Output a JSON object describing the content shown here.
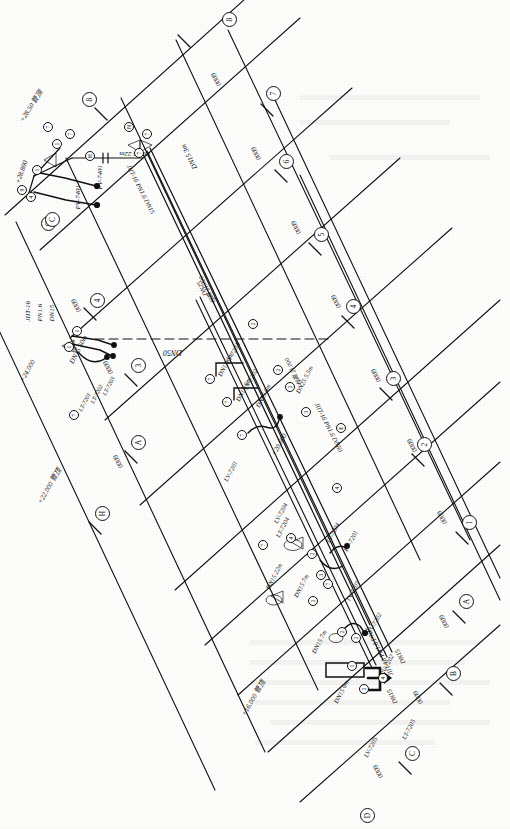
{
  "drawing": {
    "type": "piping-instrumentation-isometric",
    "orientation": "rotated-90",
    "sheet_color": "#fdfdfc",
    "line_color": "#111111",
    "grid_dimension_label": "6000"
  },
  "grid": {
    "column_markers": [
      "1",
      "2",
      "3",
      "4",
      "5",
      "6",
      "7",
      "8"
    ],
    "row_markers": [
      "A",
      "B",
      "C",
      "D",
      "E",
      "F",
      "G",
      "H"
    ],
    "dimension_labels": [
      "6000",
      "6000",
      "6000",
      "6000",
      "6000",
      "6000",
      "6000",
      "6000",
      "6000",
      "6000",
      "6000",
      "6000"
    ]
  },
  "spec_notes": [
    {
      "id": "spec-1",
      "line1": "JIIT-16",
      "line2": "PN1.6",
      "line3": "DN15"
    },
    {
      "id": "spec-2",
      "text": "JIIT-16 PN1.6 DN15"
    },
    {
      "id": "spec-3",
      "text": "JIIT-16 PN1.6 DN60"
    },
    {
      "id": "spec-4",
      "text": "JIIT-16 PN1.6 DN15"
    }
  ],
  "elevations": [
    {
      "id": "elev-1",
      "text": "+28.50 管顶"
    },
    {
      "id": "elev-2",
      "text": "+28.800"
    },
    {
      "id": "elev-3",
      "text": "+24.000"
    },
    {
      "id": "elev-4",
      "text": "+22.000 管顶"
    },
    {
      "id": "elev-5",
      "text": "+20.600"
    },
    {
      "id": "elev-6",
      "text": "+16.000 管顶"
    },
    {
      "id": "elev-7",
      "text": "标高 21.000"
    },
    {
      "id": "elev-8",
      "text": "标高 21.000"
    }
  ],
  "pipe_labels": [
    {
      "id": "pipe-1",
      "text": "DN15 22m"
    },
    {
      "id": "pipe-2",
      "text": "DN15 3m"
    },
    {
      "id": "pipe-3",
      "text": "DN15 50m"
    },
    {
      "id": "pipe-4",
      "text": "DN50"
    },
    {
      "id": "pipe-5",
      "text": "DN15 6m"
    },
    {
      "id": "pipe-6",
      "text": "DN15 6m"
    },
    {
      "id": "pipe-7",
      "text": "DN15 6m"
    },
    {
      "id": "pipe-8",
      "text": "DN25 5.5m"
    },
    {
      "id": "pipe-9",
      "text": "DN25"
    },
    {
      "id": "pipe-10",
      "text": "DN15 22m"
    },
    {
      "id": "pipe-11",
      "text": "DN15 7m"
    },
    {
      "id": "pipe-12",
      "text": "DN15 7m"
    },
    {
      "id": "pipe-13",
      "text": "DN15 6m"
    },
    {
      "id": "pipe-14",
      "text": "DN15"
    },
    {
      "id": "pipe-15",
      "text": "DN15"
    }
  ],
  "instrument_tags": [
    {
      "id": "tag-1",
      "text": "PV-7401"
    },
    {
      "id": "tag-2",
      "text": "PV-7401"
    },
    {
      "id": "tag-3",
      "text": "LT-7201"
    },
    {
      "id": "tag-4",
      "text": "LT-7202"
    },
    {
      "id": "tag-5",
      "text": "LT-7203"
    },
    {
      "id": "tag-6",
      "text": "LV-720A"
    },
    {
      "id": "tag-7",
      "text": "LV-7202"
    },
    {
      "id": "tag-8",
      "text": "LV-7201"
    },
    {
      "id": "tag-9",
      "text": "LT-7204"
    },
    {
      "id": "tag-10",
      "text": "TV-7204"
    },
    {
      "id": "tag-11",
      "text": "PV-7201"
    },
    {
      "id": "tag-12",
      "text": "TV-7201"
    },
    {
      "id": "tag-13",
      "text": "TV-7202"
    },
    {
      "id": "tag-14",
      "text": "PV-7202"
    },
    {
      "id": "tag-15",
      "text": "LT-7205"
    },
    {
      "id": "tag-16",
      "text": "LV-7205"
    },
    {
      "id": "tag-17",
      "text": "LV-7204"
    }
  ],
  "bubbles": {
    "grid_column": [
      {
        "label": "8",
        "x": 228,
        "y": 18
      },
      {
        "label": "7",
        "x": 272,
        "y": 92
      },
      {
        "label": "6",
        "x": 285,
        "y": 160
      },
      {
        "label": "5",
        "x": 320,
        "y": 233
      },
      {
        "label": "4",
        "x": 352,
        "y": 305
      },
      {
        "label": "3",
        "x": 392,
        "y": 377
      },
      {
        "label": "2",
        "x": 423,
        "y": 443
      },
      {
        "label": "1",
        "x": 468,
        "y": 521
      }
    ],
    "grid_row": [
      {
        "label": "8",
        "x": 88,
        "y": 98
      },
      {
        "label": "G",
        "x": 47,
        "y": 222
      },
      {
        "label": "4",
        "x": 96,
        "y": 299
      },
      {
        "label": "3",
        "x": 137,
        "y": 364
      },
      {
        "label": "A",
        "x": 137,
        "y": 441
      },
      {
        "label": "H",
        "x": 101,
        "y": 512
      },
      {
        "label": "A",
        "x": 465,
        "y": 600
      },
      {
        "label": "B",
        "x": 452,
        "y": 672
      },
      {
        "label": "C",
        "x": 411,
        "y": 752
      },
      {
        "label": "D",
        "x": 366,
        "y": 814
      },
      {
        "label": "C",
        "x": 51,
        "y": 218
      }
    ],
    "instrument": [
      {
        "label": "7",
        "x": 47,
        "y": 126
      },
      {
        "label": "7",
        "x": 69,
        "y": 133
      },
      {
        "label": "1",
        "x": 56,
        "y": 143
      },
      {
        "label": "1",
        "x": 36,
        "y": 169
      },
      {
        "label": "9",
        "x": 21,
        "y": 189
      },
      {
        "label": "4",
        "x": 30,
        "y": 196
      },
      {
        "label": "H",
        "x": 89,
        "y": 155
      },
      {
        "label": "N",
        "x": 128,
        "y": 126
      },
      {
        "label": "7",
        "x": 146,
        "y": 133
      },
      {
        "label": "7",
        "x": 138,
        "y": 152
      },
      {
        "label": "1",
        "x": 76,
        "y": 330
      },
      {
        "label": "1",
        "x": 68,
        "y": 346
      },
      {
        "label": "7",
        "x": 73,
        "y": 414
      },
      {
        "label": "7",
        "x": 209,
        "y": 378
      },
      {
        "label": "2",
        "x": 252,
        "y": 323
      },
      {
        "label": "7",
        "x": 226,
        "y": 401
      },
      {
        "label": "2",
        "x": 277,
        "y": 369
      },
      {
        "label": "7",
        "x": 241,
        "y": 434
      },
      {
        "label": "2",
        "x": 289,
        "y": 386
      },
      {
        "label": "3",
        "x": 305,
        "y": 411
      },
      {
        "label": "E",
        "x": 340,
        "y": 427
      },
      {
        "label": "4",
        "x": 336,
        "y": 487
      },
      {
        "label": "4",
        "x": 290,
        "y": 537
      },
      {
        "label": "7",
        "x": 262,
        "y": 544
      },
      {
        "label": "2",
        "x": 311,
        "y": 553
      },
      {
        "label": "3",
        "x": 320,
        "y": 574
      },
      {
        "label": "7",
        "x": 327,
        "y": 583
      },
      {
        "label": "2",
        "x": 312,
        "y": 600
      },
      {
        "label": "2",
        "x": 341,
        "y": 631
      },
      {
        "label": "2",
        "x": 355,
        "y": 637
      },
      {
        "label": "1",
        "x": 351,
        "y": 665
      },
      {
        "label": "2",
        "x": 363,
        "y": 688
      },
      {
        "label": "4",
        "x": 382,
        "y": 677
      }
    ]
  }
}
